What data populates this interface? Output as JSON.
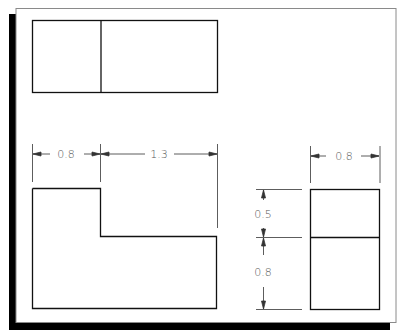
{
  "colors": {
    "background": "#ffffff",
    "sheet_border": "#8a8a8a",
    "shadow": "#000000",
    "object_line": "#111111",
    "dimension_line": "#333333",
    "dimension_text": "#555555"
  },
  "views": {
    "top": {
      "label": "top-view",
      "partitions": 2
    },
    "front": {
      "label": "front-view",
      "shape": "L-shape"
    },
    "side": {
      "label": "side-view",
      "partitions": 2
    }
  },
  "dimensions": {
    "front_left_width": "0.8",
    "front_right_width": "1.3",
    "side_width": "0.8",
    "side_upper_height": "0.5",
    "side_lower_height": "0.8"
  }
}
